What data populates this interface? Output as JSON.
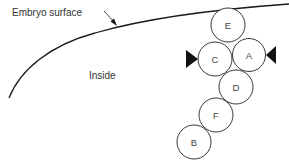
{
  "diagram": {
    "surface_label": "Embryo surface",
    "inside_label": "Inside",
    "colors": {
      "line": "#1a1a1a",
      "text": "#333333",
      "cell_fill": "#ffffff",
      "marker": "#111111"
    },
    "cells": [
      {
        "id": "E",
        "label": "E",
        "cx": 228,
        "cy": 25,
        "r": 17
      },
      {
        "id": "C",
        "label": "C",
        "cx": 215,
        "cy": 59,
        "r": 17
      },
      {
        "id": "A",
        "label": "A",
        "cx": 249,
        "cy": 55,
        "r": 16.5
      },
      {
        "id": "D",
        "label": "D",
        "cx": 236,
        "cy": 87,
        "r": 17
      },
      {
        "id": "F",
        "label": "F",
        "cx": 216,
        "cy": 115,
        "r": 17
      },
      {
        "id": "B",
        "label": "B",
        "cx": 194,
        "cy": 142,
        "r": 17
      }
    ],
    "markers": [
      {
        "id": "left-triangle",
        "direction": "right"
      },
      {
        "id": "right-triangle",
        "direction": "left"
      }
    ]
  }
}
